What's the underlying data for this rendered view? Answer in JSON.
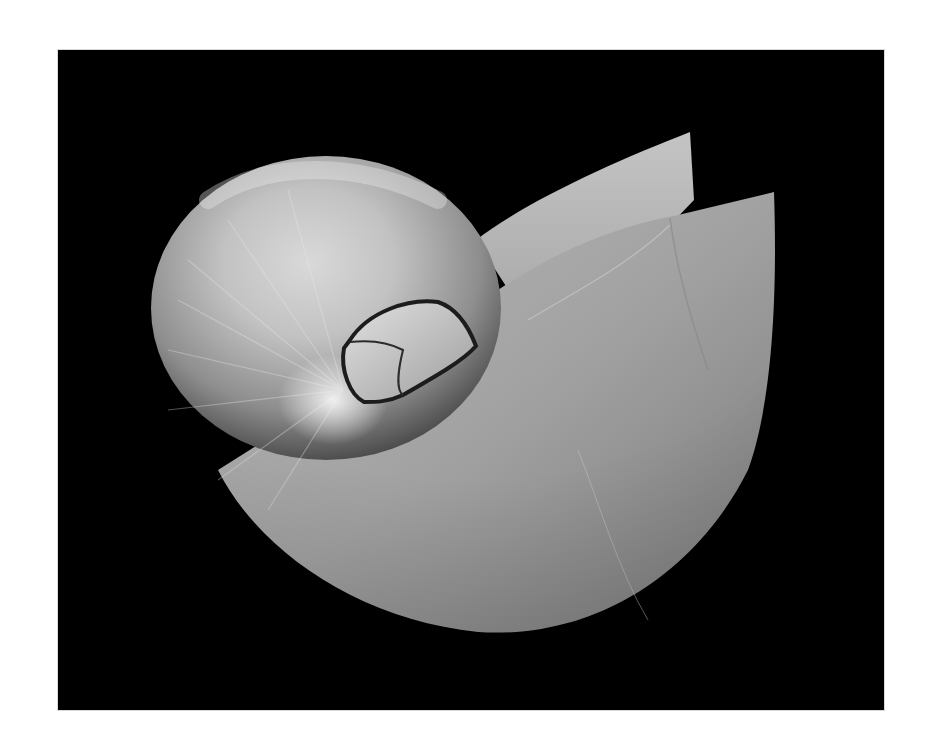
{
  "image": {
    "subject": "Nautilus shell",
    "style": "black-and-white studio photograph",
    "background": "black",
    "border": "white",
    "colors": {
      "page": "#ffffff",
      "backdrop": "#000000",
      "shell_highlight": "#e6e6e6",
      "shell_mid": "#9a9a9a",
      "shell_shadow": "#3a3a3a"
    }
  }
}
